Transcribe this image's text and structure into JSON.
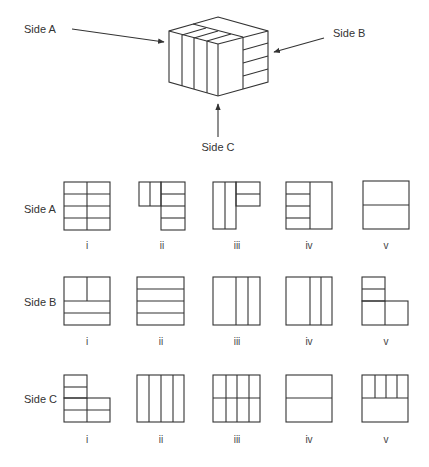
{
  "cube": {
    "label_a": "Side A",
    "label_b": "Side B",
    "label_c": "Side C"
  },
  "rows": [
    {
      "label": "Side A",
      "options": [
        "i",
        "ii",
        "iii",
        "iv",
        "v"
      ]
    },
    {
      "label": "Side B",
      "options": [
        "i",
        "ii",
        "iii",
        "iv",
        "v"
      ]
    },
    {
      "label": "Side C",
      "options": [
        "i",
        "ii",
        "iii",
        "iv",
        "v"
      ]
    }
  ],
  "colors": {
    "line": "#333333",
    "background": "#ffffff"
  }
}
